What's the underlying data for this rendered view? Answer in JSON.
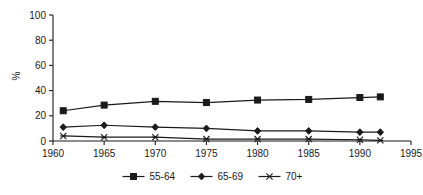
{
  "chart_data": {
    "type": "line",
    "title": "",
    "subtitle": "",
    "xlabel": "",
    "ylabel": "%",
    "xlim": [
      1960,
      1995
    ],
    "ylim": [
      0,
      100
    ],
    "x_ticks": [
      1960,
      1965,
      1970,
      1975,
      1980,
      1985,
      1990,
      1995
    ],
    "y_ticks": [
      0,
      20,
      40,
      60,
      80,
      100
    ],
    "grid": false,
    "legend_position": "bottom",
    "x": [
      1961,
      1965,
      1970,
      1975,
      1980,
      1985,
      1990,
      1992
    ],
    "series": [
      {
        "name": "55-64",
        "marker": "square",
        "values": [
          24,
          28.5,
          31.5,
          30.5,
          32.5,
          33,
          34.5,
          35
        ]
      },
      {
        "name": "65-69",
        "marker": "diamond",
        "values": [
          11,
          12.5,
          11,
          10,
          8,
          8,
          7,
          7
        ]
      },
      {
        "name": "70+",
        "marker": "star",
        "values": [
          4,
          3,
          3,
          1.5,
          1.5,
          1.5,
          1,
          0.5
        ]
      }
    ],
    "colors": {
      "axis": "#1a1a1a",
      "series_55_64": "#1a1a1a",
      "series_65_69": "#1a1a1a",
      "series_70_plus": "#1a1a1a",
      "background": "#ffffff"
    }
  },
  "axes": {
    "y_label": "%",
    "y_tick_labels": [
      "0",
      "20",
      "40",
      "60",
      "80",
      "100"
    ],
    "x_tick_labels": [
      "1960",
      "1965",
      "1970",
      "1975",
      "1980",
      "1985",
      "1990",
      "1995"
    ]
  },
  "legend": {
    "items": [
      {
        "label": "55-64",
        "marker": "square-marker"
      },
      {
        "label": "65-69",
        "marker": "diamond-marker"
      },
      {
        "label": "70+",
        "marker": "star-marker"
      }
    ]
  }
}
